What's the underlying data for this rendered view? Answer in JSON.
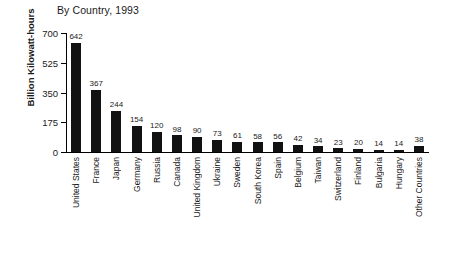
{
  "chart_data": {
    "type": "bar",
    "title": "By Country, 1993",
    "xlabel": "",
    "ylabel": "Billion Kilowatt-hours",
    "ylim": [
      0,
      700
    ],
    "yticks": [
      0,
      175,
      350,
      525,
      700
    ],
    "grid": false,
    "legend": null,
    "bar_color": "#121212",
    "categories": [
      "United States",
      "France",
      "Japan",
      "Germany",
      "Russia",
      "Canada",
      "United Kingdom",
      "Ukraine",
      "Sweden",
      "South Korea",
      "Spain",
      "Belgium",
      "Taiwan",
      "Switzerland",
      "Finland",
      "Bulgaria",
      "Hungary",
      "Other Countries"
    ],
    "values": [
      642,
      367,
      244,
      154,
      120,
      98,
      90,
      73,
      61,
      58,
      56,
      42,
      34,
      23,
      20,
      14,
      14,
      38
    ]
  }
}
